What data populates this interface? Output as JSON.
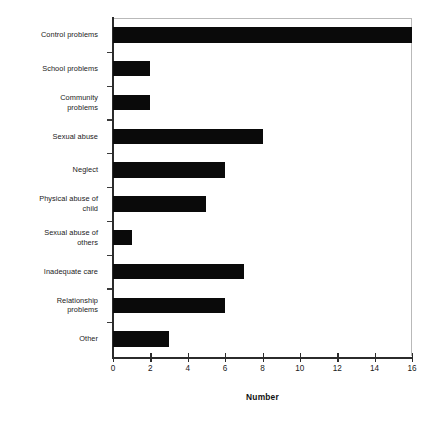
{
  "chart_data": {
    "type": "bar",
    "orientation": "horizontal",
    "title": "",
    "xlabel": "Number",
    "ylabel": "",
    "categories": [
      "Control problems",
      "School problems",
      "Community problems",
      "Sexual abuse",
      "Neglect",
      "Physical abuse of child",
      "Sexual abuse of others",
      "Inadequate care",
      "Relationship problems",
      "Other"
    ],
    "category_label_lines": [
      "Control problems",
      "School problems",
      "Community\nproblems",
      "Sexual abuse",
      "Neglect",
      "Physical abuse of\nchild",
      "Sexual abuse of\nothers",
      "Inadequate care",
      "Relationship\nproblems",
      "Other"
    ],
    "values": [
      16,
      2,
      2,
      8,
      6,
      5,
      1,
      7,
      6,
      3
    ],
    "xlim": [
      0,
      16
    ],
    "xticks": [
      0,
      2,
      4,
      6,
      8,
      10,
      12,
      14,
      16
    ],
    "xticklabels": [
      "0",
      "2",
      "4",
      "6",
      "8",
      "10",
      "12",
      "14",
      "16"
    ],
    "grid": false,
    "legend": null,
    "bar_color": "#0a0a0a",
    "axis_color": "#2b2b2b",
    "frame_color": "#b9b9b9",
    "background_color": "#ffffff"
  }
}
